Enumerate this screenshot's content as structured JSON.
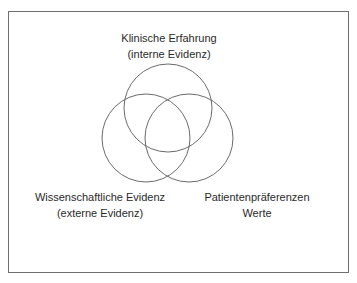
{
  "diagram": {
    "type": "venn",
    "sets": [
      {
        "id": "clinical",
        "line1": "Klinische Erfahrung",
        "line2": "(interne Evidenz)",
        "circle": {
          "cx": 168,
          "cy": 108,
          "r": 44
        }
      },
      {
        "id": "scientific",
        "line1": "Wissenschaftliche Evidenz",
        "line2": "(externe Evidenz)",
        "circle": {
          "cx": 146,
          "cy": 138,
          "r": 44
        }
      },
      {
        "id": "patient",
        "line1": "Patientenpräferenzen",
        "line2": "Werte",
        "circle": {
          "cx": 189,
          "cy": 138,
          "r": 44
        }
      }
    ],
    "colors": {
      "stroke": "#6a6a6a",
      "text": "#2a2a2a",
      "frame": "#6f6f6f"
    }
  }
}
